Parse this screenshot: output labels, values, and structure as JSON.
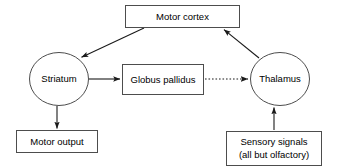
{
  "diagram": {
    "background_color": "#ffffff",
    "stroke_color": "#1a1a1a",
    "box_stroke_color": "#4d4d4d",
    "nodes": [
      {
        "id": "motor-cortex",
        "label": "Motor cortex",
        "shape": "rect",
        "x": 125,
        "y": 5,
        "width": 115,
        "height": 23,
        "cx": 182.5,
        "cy": 16.5
      },
      {
        "id": "striatum",
        "label": "Striatum",
        "shape": "ellipse",
        "cx": 59,
        "cy": 79,
        "rx": 30,
        "ry": 27
      },
      {
        "id": "globus-pallidus",
        "label": "Globus pallidus",
        "shape": "rect",
        "x": 122,
        "y": 64,
        "width": 82,
        "height": 31,
        "cx": 163,
        "cy": 79.5
      },
      {
        "id": "thalamus",
        "label": "Thalamus",
        "shape": "ellipse",
        "cx": 280,
        "cy": 79,
        "rx": 30,
        "ry": 27
      },
      {
        "id": "motor-output",
        "label": "Motor output",
        "shape": "rect",
        "x": 16,
        "y": 130,
        "width": 82,
        "height": 23,
        "cx": 57,
        "cy": 141.5
      },
      {
        "id": "sensory-signals",
        "label_line1": "Sensory signals",
        "label_line2": "(all but olfactory)",
        "shape": "rect",
        "x": 226,
        "y": 131,
        "width": 96,
        "height": 35,
        "cx": 274,
        "cy": 148.5
      }
    ],
    "edges": [
      {
        "id": "motor-cortex-to-striatum",
        "from": "motor-cortex",
        "to": "striatum",
        "style": "solid",
        "arrow": "end",
        "x1": 144,
        "y1": 28,
        "x2": 80,
        "y2": 58
      },
      {
        "id": "striatum-to-globus-pallidus",
        "from": "striatum",
        "to": "globus-pallidus",
        "style": "solid",
        "arrow": "end",
        "x1": 89,
        "y1": 79,
        "x2": 121,
        "y2": 79
      },
      {
        "id": "globus-pallidus-to-thalamus",
        "from": "globus-pallidus",
        "to": "thalamus",
        "style": "dotted",
        "arrow": "end",
        "x1": 205,
        "y1": 79,
        "x2": 249,
        "y2": 79
      },
      {
        "id": "thalamus-to-motor-cortex",
        "from": "thalamus",
        "to": "motor-cortex",
        "style": "solid",
        "arrow": "end",
        "x1": 259,
        "y1": 58,
        "x2": 223,
        "y2": 29
      },
      {
        "id": "striatum-to-motor-output",
        "from": "striatum",
        "to": "motor-output",
        "style": "solid",
        "arrow": "end",
        "x1": 57,
        "y1": 106,
        "x2": 57,
        "y2": 129
      },
      {
        "id": "sensory-signals-to-thalamus",
        "from": "sensory-signals",
        "to": "thalamus",
        "style": "solid",
        "arrow": "end",
        "x1": 274,
        "y1": 130,
        "x2": 274,
        "y2": 107
      }
    ]
  }
}
